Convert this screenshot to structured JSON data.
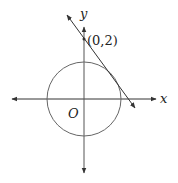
{
  "diagram": {
    "type": "coordinate-geometry",
    "labels": {
      "x_axis": "x",
      "y_axis": "y",
      "origin": "O",
      "point": "(0,2)"
    },
    "colors": {
      "stroke": "#333333",
      "circle": "#666666",
      "text": "#222222"
    }
  }
}
